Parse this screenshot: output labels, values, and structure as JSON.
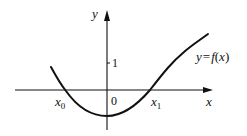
{
  "figure": {
    "axes": {
      "x_label": "x",
      "y_label": "y",
      "origin_label": "0",
      "y_tick_label": "1"
    },
    "curve": {
      "label": "y = f(x)",
      "label_parts": {
        "y": "y",
        "eq": "=",
        "f": "f",
        "open": "(",
        "x": "x",
        "close": ")"
      }
    },
    "roots": [
      {
        "base": "x",
        "sub": "0"
      },
      {
        "base": "x",
        "sub": "1"
      }
    ],
    "colors": {
      "stroke": "#111111",
      "background": "#ffffff"
    }
  }
}
